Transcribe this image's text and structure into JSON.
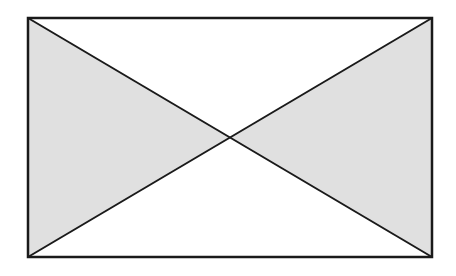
{
  "diagram": {
    "rect": {
      "x": 28,
      "y": 18,
      "width": 404,
      "height": 239
    },
    "center": {
      "x": 230,
      "y": 137.5
    },
    "colors": {
      "stroke": "#1a1a1a",
      "shaded_fill": "#e0e0e0",
      "unshaded_fill": "#ffffff"
    },
    "regions": [
      {
        "name": "left-triangle",
        "shaded": true
      },
      {
        "name": "right-triangle",
        "shaded": true
      },
      {
        "name": "top-triangle",
        "shaded": false
      },
      {
        "name": "bottom-triangle",
        "shaded": false
      }
    ]
  }
}
